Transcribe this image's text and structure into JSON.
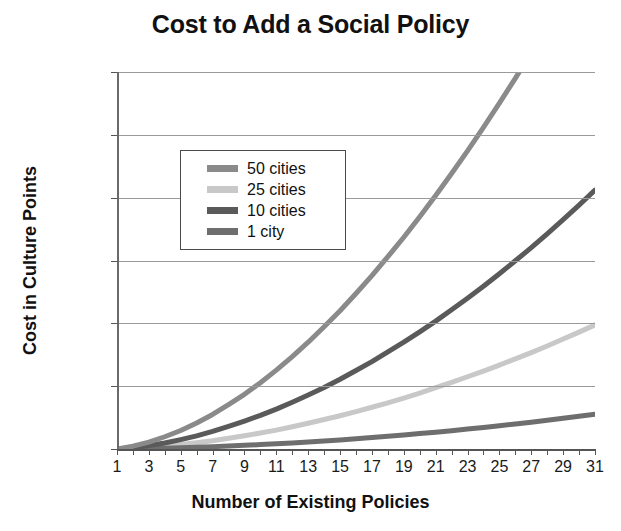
{
  "chart_data": {
    "type": "line",
    "title": "Cost to Add a Social Policy",
    "xlabel": "Number of Existing Policies",
    "ylabel": "Cost in Culture Points",
    "xlim": [
      1,
      31
    ],
    "ylim": [
      0,
      120000
    ],
    "grid": true,
    "legend_position": "upper-left-inside",
    "x": [
      1,
      2,
      3,
      4,
      5,
      6,
      7,
      8,
      9,
      10,
      11,
      12,
      13,
      14,
      15,
      16,
      17,
      18,
      19,
      20,
      21,
      22,
      23,
      24,
      25,
      26,
      27,
      28,
      29,
      30,
      31
    ],
    "xticks": [
      1,
      3,
      5,
      7,
      9,
      11,
      13,
      15,
      17,
      19,
      21,
      23,
      25,
      27,
      29,
      31
    ],
    "yticks": [
      0,
      20000,
      40000,
      60000,
      80000,
      100000,
      120000
    ],
    "ytick_labels": [
      "0",
      "20,000",
      "40,000",
      "60,000",
      "80,000",
      "100,000",
      "120,000"
    ],
    "series": [
      {
        "name": "50 cities",
        "color": "#8a8a8a",
        "values": [
          0,
          900,
          2200,
          3900,
          5900,
          8300,
          11000,
          14100,
          17400,
          21100,
          25100,
          29400,
          34000,
          38900,
          44000,
          49500,
          55200,
          61200,
          67400,
          73900,
          80700,
          87700,
          94900,
          102400,
          110100,
          118000,
          126200,
          134500,
          143100,
          151900,
          160900
        ]
      },
      {
        "name": "25 cities",
        "color": "#c8c8c8",
        "values": [
          0,
          200,
          500,
          900,
          1400,
          2000,
          2600,
          3400,
          4200,
          5100,
          6000,
          7100,
          8200,
          9400,
          10600,
          11900,
          13300,
          14700,
          16200,
          17800,
          19500,
          21200,
          23000,
          24800,
          26700,
          28700,
          30700,
          32800,
          35000,
          37200,
          39500
        ]
      },
      {
        "name": "10 cities",
        "color": "#5a5a5a",
        "values": [
          0,
          400,
          1100,
          1900,
          3000,
          4200,
          5600,
          7200,
          8900,
          10700,
          12700,
          14900,
          17200,
          19600,
          22200,
          25000,
          27800,
          30900,
          34000,
          37300,
          40700,
          44300,
          48000,
          51800,
          55800,
          59900,
          64100,
          68500,
          73000,
          77600,
          82400
        ]
      },
      {
        "name": "1 city",
        "color": "#6e6e6e",
        "values": [
          0,
          60,
          150,
          260,
          400,
          560,
          740,
          940,
          1160,
          1400,
          1660,
          1940,
          2240,
          2560,
          2900,
          3260,
          3640,
          4040,
          4460,
          4900,
          5360,
          5840,
          6340,
          6860,
          7400,
          7960,
          8540,
          9140,
          9760,
          10400,
          11060
        ]
      }
    ]
  }
}
